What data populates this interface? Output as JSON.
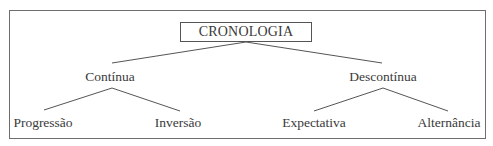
{
  "diagram": {
    "type": "tree",
    "root": {
      "label": "CRONOLOGIA",
      "children": [
        {
          "label": "Contínua",
          "children": [
            {
              "label": "Progressão"
            },
            {
              "label": "Inversão"
            }
          ]
        },
        {
          "label": "Descontínua",
          "children": [
            {
              "label": "Expectativa"
            },
            {
              "label": "Alternância"
            }
          ]
        }
      ]
    },
    "colors": {
      "line": "#555555",
      "text": "#3a3a3a",
      "frame": "#6e6e6e"
    }
  }
}
